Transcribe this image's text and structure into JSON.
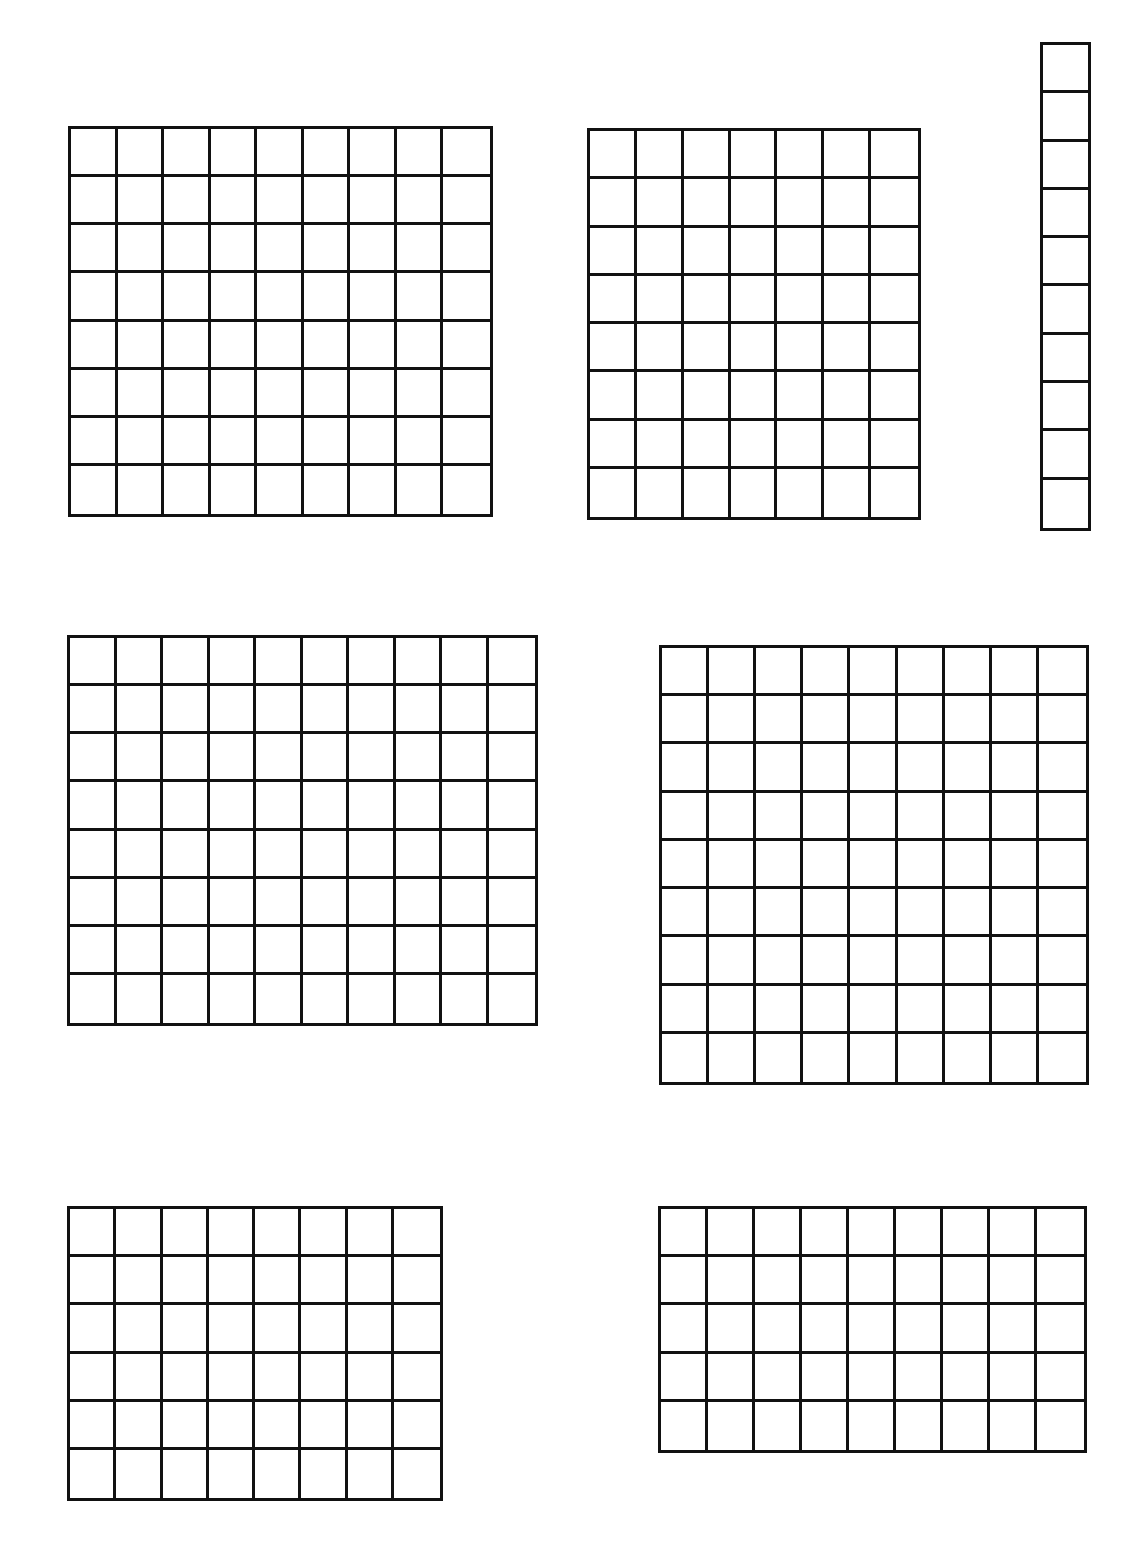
{
  "page": {
    "background": "#ffffff",
    "line_color": "#111111"
  },
  "grids": [
    {
      "id": "grid-9x8-top-left",
      "cols": 9,
      "rows": 8,
      "x": 68,
      "y": 126,
      "w": 425,
      "h": 391
    },
    {
      "id": "grid-7x8-top-middle",
      "cols": 7,
      "rows": 8,
      "x": 587,
      "y": 128,
      "w": 334,
      "h": 392
    },
    {
      "id": "strip-1x10-top-right",
      "cols": 1,
      "rows": 10,
      "x": 1040,
      "y": 42,
      "w": 51,
      "h": 489
    },
    {
      "id": "grid-10x8-middle-left",
      "cols": 10,
      "rows": 8,
      "x": 67,
      "y": 635,
      "w": 471,
      "h": 391
    },
    {
      "id": "grid-9x9-middle-right",
      "cols": 9,
      "rows": 9,
      "x": 659,
      "y": 645,
      "w": 430,
      "h": 440
    },
    {
      "id": "grid-8x6-bottom-left",
      "cols": 8,
      "rows": 6,
      "x": 67,
      "y": 1206,
      "w": 376,
      "h": 295
    },
    {
      "id": "grid-9x5-bottom-right",
      "cols": 9,
      "rows": 5,
      "x": 658,
      "y": 1206,
      "w": 429,
      "h": 247
    }
  ]
}
